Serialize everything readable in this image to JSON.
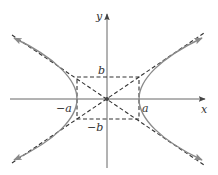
{
  "diagram": {
    "title": "",
    "type": "hyperbola",
    "equation_form": "x^2/a^2 - y^2/b^2 = 1",
    "labels": {
      "x_axis": "x",
      "y_axis": "y",
      "a_pos": "a",
      "a_neg": "−a",
      "b_pos": "b",
      "b_neg": "−b"
    },
    "geometry": {
      "origin": [
        107,
        99
      ],
      "a_px": 31,
      "b_px": 21
    },
    "colors": {
      "curve": "#8a8a8a",
      "axes": "#555555",
      "dashed": "#333333",
      "text": "#333333"
    }
  }
}
